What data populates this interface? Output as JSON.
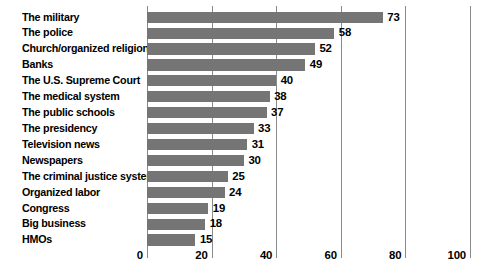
{
  "chart_data": {
    "type": "bar",
    "orientation": "horizontal",
    "title": "",
    "subtitle": "",
    "xlabel": "",
    "ylabel": "",
    "xlim": [
      0,
      100
    ],
    "grid": true,
    "legend": null,
    "xticks": [
      0,
      20,
      40,
      60,
      80,
      100
    ],
    "xtick_labels": [
      "0",
      "20",
      "40",
      "60",
      "80",
      "100"
    ],
    "bar_color": "#757575",
    "gridline_color": "#8a8a8a",
    "categories": [
      "The military",
      "The police",
      "Church/organized religion",
      "Banks",
      "The U.S. Supreme Court",
      "The medical system",
      "The public schools",
      "The presidency",
      "Television news",
      "Newspapers",
      "The criminal justice system",
      "Organized labor",
      "Congress",
      "Big business",
      "HMOs"
    ],
    "values": [
      73,
      58,
      52,
      49,
      40,
      38,
      37,
      33,
      31,
      30,
      25,
      24,
      19,
      18,
      15
    ],
    "value_labels": [
      "73",
      "58",
      "52",
      "49",
      "40",
      "38",
      "37",
      "33",
      "31",
      "30",
      "25",
      "24",
      "19",
      "18",
      "15"
    ]
  }
}
